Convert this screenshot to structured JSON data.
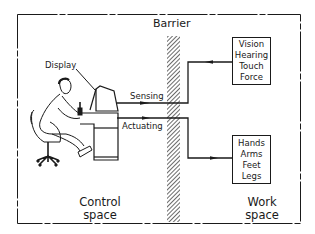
{
  "diagram": {
    "barrier_label": "Barrier",
    "display_label": "Display",
    "sensing_label": "Sensing",
    "actuating_label": "Actuating",
    "control_space": {
      "line1": "Control",
      "line2": "space"
    },
    "work_space": {
      "line1": "Work",
      "line2": "space"
    },
    "sensing_box": {
      "items": [
        "Vision",
        "Hearing",
        "Touch",
        "Force"
      ]
    },
    "actuating_box": {
      "items": [
        "Hands",
        "Arms",
        "Feet",
        "Legs"
      ]
    },
    "colors": {
      "ink": "#1a1a1a",
      "background": "#ffffff"
    }
  }
}
